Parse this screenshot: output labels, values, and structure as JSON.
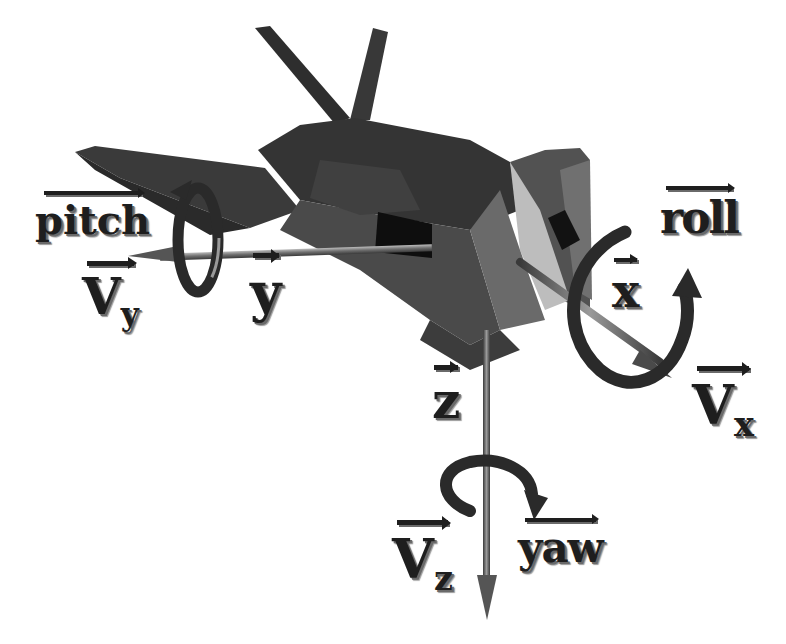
{
  "diagram": {
    "colors": {
      "background": "#ffffff",
      "aircraft_dark": "#2e2e2e",
      "aircraft_mid": "#4a4a4a",
      "aircraft_light": "#8c8c8c",
      "aircraft_highlight": "#c8c8c8",
      "label": "#1e1e1e",
      "axis_rod": "#6e6e6e"
    },
    "axes": {
      "x": {
        "label": "x",
        "direction": "forward (nose)"
      },
      "y": {
        "label": "y",
        "direction": "left wing"
      },
      "z": {
        "label": "z",
        "direction": "down"
      }
    },
    "rotations": {
      "pitch": {
        "label": "pitch",
        "about": "y"
      },
      "roll": {
        "label": "roll",
        "about": "x"
      },
      "yaw": {
        "label": "yaw",
        "about": "z"
      }
    },
    "velocities": {
      "vx": {
        "base": "V",
        "sub": "x"
      },
      "vy": {
        "base": "V",
        "sub": "y"
      },
      "vz": {
        "base": "V",
        "sub": "z"
      }
    }
  }
}
